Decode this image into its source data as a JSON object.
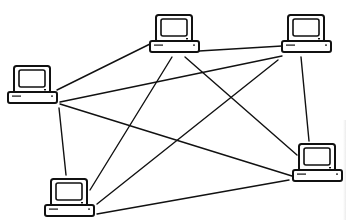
{
  "diagram": {
    "type": "network-mesh",
    "stroke_color": "#111111",
    "background_color": "#ffffff",
    "nodes": [
      {
        "id": "computer-top-center",
        "label": "Computer",
        "x": 150,
        "y": 15
      },
      {
        "id": "computer-top-right",
        "label": "Computer",
        "x": 282,
        "y": 15
      },
      {
        "id": "computer-left",
        "label": "Computer",
        "x": 8,
        "y": 66
      },
      {
        "id": "computer-bottom-right",
        "label": "Computer",
        "x": 293,
        "y": 144
      },
      {
        "id": "computer-bottom-left",
        "label": "Computer",
        "x": 45,
        "y": 179
      }
    ],
    "links": [
      {
        "from": "computer-left",
        "to": "computer-top-center"
      },
      {
        "from": "computer-left",
        "to": "computer-top-right"
      },
      {
        "from": "computer-left",
        "to": "computer-bottom-right"
      },
      {
        "from": "computer-left",
        "to": "computer-bottom-left"
      },
      {
        "from": "computer-top-center",
        "to": "computer-top-right"
      },
      {
        "from": "computer-top-center",
        "to": "computer-bottom-left"
      },
      {
        "from": "computer-top-center",
        "to": "computer-bottom-right"
      },
      {
        "from": "computer-top-right",
        "to": "computer-bottom-left"
      },
      {
        "from": "computer-top-right",
        "to": "computer-bottom-right"
      },
      {
        "from": "computer-bottom-left",
        "to": "computer-bottom-right"
      }
    ]
  }
}
